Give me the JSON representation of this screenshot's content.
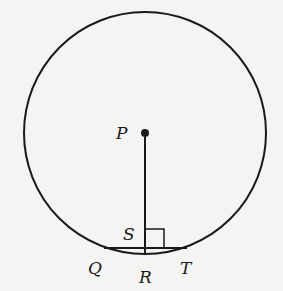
{
  "diagram": {
    "colors": {
      "stroke": "#1a1a1a",
      "background": "#f4f4f2"
    },
    "circle": {
      "center_label": "P",
      "cx": 145,
      "cy": 133,
      "r": 121
    },
    "labels": {
      "P": "P",
      "S": "S",
      "Q": "Q",
      "R": "R",
      "T": "T"
    },
    "right_angle_marker": "square at S"
  }
}
